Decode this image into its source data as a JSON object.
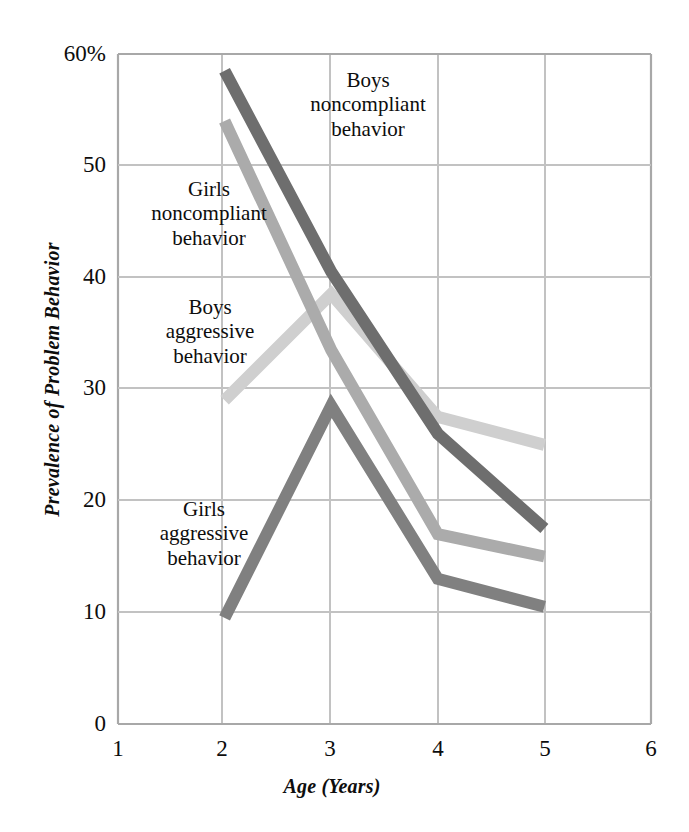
{
  "chart_data": {
    "type": "line",
    "title": "",
    "xlabel": "Age (Years)",
    "ylabel": "Prevalence of Problem Behavior",
    "x": [
      2,
      3,
      4,
      5
    ],
    "xlim": [
      1,
      6
    ],
    "ylim": [
      0,
      60
    ],
    "xticks": [
      "1",
      "2",
      "3",
      "4",
      "5",
      "6"
    ],
    "yticks": [
      "0",
      "10",
      "20",
      "30",
      "40",
      "50",
      "60%"
    ],
    "grid": true,
    "legend_position": "inline-annotations",
    "series": [
      {
        "name": "Boys noncompliant behavior",
        "color": "#6e6e6e",
        "values": [
          58.5,
          40.5,
          26.0,
          17.5
        ]
      },
      {
        "name": "Girls noncompliant behavior",
        "color": "#ababab",
        "values": [
          54.0,
          33.5,
          17.0,
          15.0
        ]
      },
      {
        "name": "Boys aggressive behavior",
        "color": "#cfcfcf",
        "values": [
          29.0,
          38.5,
          27.5,
          25.0
        ]
      },
      {
        "name": "Girls aggressive behavior",
        "color": "#808080",
        "values": [
          9.5,
          28.5,
          13.0,
          10.5
        ]
      }
    ]
  },
  "axes": {
    "xlabel": "Age (Years)",
    "ylabel": "Prevalence of Problem Behavior",
    "yticks": [
      {
        "text": "60%",
        "value": 60
      },
      {
        "text": "50",
        "value": 50
      },
      {
        "text": "40",
        "value": 40
      },
      {
        "text": "30",
        "value": 30
      },
      {
        "text": "20",
        "value": 20
      },
      {
        "text": "10",
        "value": 10
      },
      {
        "text": "0",
        "value": 0
      }
    ],
    "xticks": [
      {
        "text": "1",
        "value": 1
      },
      {
        "text": "2",
        "value": 2
      },
      {
        "text": "3",
        "value": 3
      },
      {
        "text": "4",
        "value": 4
      },
      {
        "text": "5",
        "value": 5
      },
      {
        "text": "6",
        "value": 6
      }
    ]
  },
  "annotations": [
    {
      "id": "boys-noncompliant",
      "line1": "Boys",
      "line2": "noncompliant",
      "line3": "behavior"
    },
    {
      "id": "girls-noncompliant",
      "line1": "Girls",
      "line2": "noncompliant",
      "line3": "behavior"
    },
    {
      "id": "boys-aggressive",
      "line1": "Boys",
      "line2": "aggressive",
      "line3": "behavior"
    },
    {
      "id": "girls-aggressive",
      "line1": "Girls",
      "line2": "aggressive",
      "line3": "behavior"
    }
  ],
  "colors": {
    "grid": "#b9b9b9",
    "axis": "#9a9a9a",
    "text": "#0d0d0d",
    "background": "#ffffff"
  }
}
